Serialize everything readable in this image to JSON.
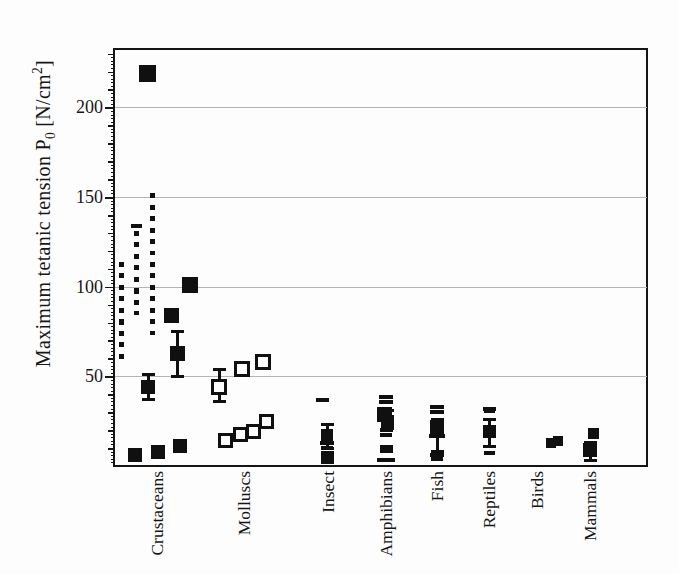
{
  "figure": {
    "background": "#fdfdfd",
    "ink_color": "#101010",
    "grid_color": "#b4b4b4"
  },
  "y_axis": {
    "label_parts": {
      "text1": "Maximum tetanic tension P",
      "sub": "0",
      "text2": "  [N/cm",
      "sup": "2",
      "text3": "]"
    }
  },
  "chart_data": {
    "type": "scatter",
    "title": "",
    "ylabel": "Maximum tetanic tension P0 [N/cm2]",
    "xlabel": "",
    "ylim": [
      0,
      232
    ],
    "yticks": [
      50,
      100,
      150,
      200
    ],
    "grid": true,
    "legend": "none",
    "marker_legend": {
      "square": "filled black square data point (mean)",
      "open-square": "open square data point",
      "dash": "short horizontal bar (single value)",
      "dotline": "dotted vertical line (value range)"
    },
    "categories": [
      "Crustaceans",
      "Molluscs",
      "Insect",
      "Amphibians",
      "Fish",
      "Reptiles",
      "Birds",
      "Mammals"
    ],
    "layout": {
      "plot_left": 115,
      "plot_right": 647,
      "plot_top": 50,
      "plot_bottom": 466,
      "ymax": 232,
      "xlabel_top": 471,
      "centers": {
        "Crustaceans": 157,
        "Molluscs": 244,
        "Insect": 328,
        "Amphibians": 386,
        "Fish": 437,
        "Reptiles": 489,
        "Birds": 537,
        "Mammals": 590
      }
    },
    "points": [
      {
        "group": "Crustaceans",
        "marker": "dotline",
        "x_offset": -36,
        "span": [
          59,
          114
        ]
      },
      {
        "group": "Crustaceans",
        "marker": "dash",
        "x_offset": -21,
        "value": 134,
        "width": 11
      },
      {
        "group": "Crustaceans",
        "marker": "dotline",
        "x_offset": -21,
        "span": [
          84,
          131
        ]
      },
      {
        "group": "Crustaceans",
        "marker": "dotline",
        "x_offset": -5,
        "span": [
          73,
          152
        ]
      },
      {
        "group": "Crustaceans",
        "marker": "square",
        "x_offset": -10,
        "value": 219,
        "size": 17
      },
      {
        "group": "Crustaceans",
        "marker": "square",
        "x_offset": 33,
        "value": 101,
        "size": 16
      },
      {
        "group": "Crustaceans",
        "marker": "square",
        "x_offset": 14,
        "value": 84,
        "size": 15
      },
      {
        "group": "Crustaceans",
        "marker": "square",
        "x_offset": 20,
        "value": 63,
        "size": 15,
        "err": [
          50,
          75
        ]
      },
      {
        "group": "Crustaceans",
        "marker": "square",
        "x_offset": -9,
        "value": 44,
        "size": 14,
        "err": [
          37,
          51
        ]
      },
      {
        "group": "Crustaceans",
        "marker": "square",
        "x_offset": -22,
        "value": 6,
        "size": 14
      },
      {
        "group": "Crustaceans",
        "marker": "square",
        "x_offset": 1,
        "value": 8,
        "size": 14
      },
      {
        "group": "Crustaceans",
        "marker": "square",
        "x_offset": 23,
        "value": 11,
        "size": 14
      },
      {
        "group": "Molluscs",
        "marker": "open-square",
        "x_offset": -25,
        "value": 44,
        "size": 16,
        "err": [
          36,
          54
        ]
      },
      {
        "group": "Molluscs",
        "marker": "open-square",
        "x_offset": -2,
        "value": 54,
        "size": 16
      },
      {
        "group": "Molluscs",
        "marker": "open-square",
        "x_offset": 19,
        "value": 58,
        "size": 16
      },
      {
        "group": "Molluscs",
        "marker": "open-square",
        "x_offset": -19,
        "value": 14,
        "size": 15
      },
      {
        "group": "Molluscs",
        "marker": "open-square",
        "x_offset": -4,
        "value": 17.5,
        "size": 15
      },
      {
        "group": "Molluscs",
        "marker": "open-square",
        "x_offset": 9,
        "value": 19.5,
        "size": 15
      },
      {
        "group": "Molluscs",
        "marker": "open-square",
        "x_offset": 22,
        "value": 25,
        "size": 15
      },
      {
        "group": "Insect",
        "marker": "dash",
        "x_offset": -6,
        "value": 37,
        "width": 13
      },
      {
        "group": "Insect",
        "marker": "square",
        "x_offset": -1,
        "value": 17.5,
        "size": 12,
        "err": [
          10,
          23
        ]
      },
      {
        "group": "Insect",
        "marker": "dash",
        "x_offset": -1,
        "value": 13,
        "width": 14
      },
      {
        "group": "Insect",
        "marker": "dash",
        "x_offset": -1,
        "value": 10,
        "width": 12
      },
      {
        "group": "Insect",
        "marker": "square",
        "x_offset": -1,
        "value": 4.5,
        "size": 13
      },
      {
        "group": "Amphibians",
        "marker": "dash",
        "x_offset": 0,
        "value": 38.5,
        "width": 14
      },
      {
        "group": "Amphibians",
        "marker": "dash",
        "x_offset": 0,
        "value": 35.5,
        "width": 14
      },
      {
        "group": "Amphibians",
        "marker": "square",
        "x_offset": -2,
        "value": 29,
        "size": 15
      },
      {
        "group": "Amphibians",
        "marker": "square",
        "x_offset": 1,
        "value": 25,
        "size": 13,
        "err": [
          21,
          31
        ]
      },
      {
        "group": "Amphibians",
        "marker": "dash",
        "x_offset": 0,
        "value": 20,
        "width": 13
      },
      {
        "group": "Amphibians",
        "marker": "dash",
        "x_offset": 0,
        "value": 17.5,
        "width": 12
      },
      {
        "group": "Amphibians",
        "marker": "dash",
        "x_offset": 0,
        "value": 10.5,
        "width": 13
      },
      {
        "group": "Amphibians",
        "marker": "dash",
        "x_offset": 0,
        "value": 8.5,
        "width": 13
      },
      {
        "group": "Amphibians",
        "marker": "dash",
        "x_offset": 0,
        "value": 3.5,
        "width": 18
      },
      {
        "group": "Fish",
        "marker": "dash",
        "x_offset": 0,
        "value": 33,
        "width": 14
      },
      {
        "group": "Fish",
        "marker": "dash",
        "x_offset": 0,
        "value": 30,
        "width": 14
      },
      {
        "group": "Fish",
        "marker": "square",
        "x_offset": 0,
        "value": 21.5,
        "size": 14,
        "err": [
          8,
          26
        ]
      },
      {
        "group": "Fish",
        "marker": "dash",
        "x_offset": 0,
        "value": 17,
        "width": 16
      },
      {
        "group": "Fish",
        "marker": "dash",
        "x_offset": 0,
        "value": 6,
        "width": 14
      },
      {
        "group": "Fish",
        "marker": "dash",
        "x_offset": 0,
        "value": 4,
        "width": 12
      },
      {
        "group": "Reptiles",
        "marker": "dash",
        "x_offset": 0,
        "value": 32,
        "width": 13
      },
      {
        "group": "Reptiles",
        "marker": "dash",
        "x_offset": 0,
        "value": 30.5,
        "width": 11
      },
      {
        "group": "Reptiles",
        "marker": "square",
        "x_offset": 0,
        "value": 19,
        "size": 13,
        "err": [
          11,
          26
        ]
      },
      {
        "group": "Reptiles",
        "marker": "dash",
        "x_offset": 0,
        "value": 7,
        "width": 11
      },
      {
        "group": "Birds",
        "marker": "square",
        "x_offset": 14,
        "value": 13,
        "size": 10
      },
      {
        "group": "Birds",
        "marker": "square",
        "x_offset": 21,
        "value": 14,
        "size": 10
      },
      {
        "group": "Mammals",
        "marker": "square",
        "x_offset": 3,
        "value": 18,
        "size": 11
      },
      {
        "group": "Mammals",
        "marker": "dash",
        "x_offset": 0,
        "value": 13,
        "width": 12
      },
      {
        "group": "Mammals",
        "marker": "square",
        "x_offset": 0,
        "value": 9,
        "size": 14,
        "err": [
          3,
          13
        ]
      }
    ]
  }
}
